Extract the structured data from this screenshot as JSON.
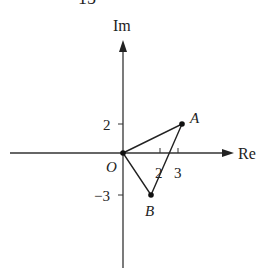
{
  "figure_number": "15",
  "axes": {
    "x_label": "Re",
    "y_label": "Im",
    "origin_label": "O",
    "x_ticks": [
      {
        "value": 2,
        "label": "2"
      },
      {
        "value": 3,
        "label": "3"
      }
    ],
    "y_ticks": [
      {
        "value": 2,
        "label": "2"
      },
      {
        "value": -3,
        "label": "-3"
      }
    ]
  },
  "points": [
    {
      "name": "O",
      "label": "O",
      "re": 0,
      "im": 0
    },
    {
      "name": "A",
      "label": "A",
      "re": 3,
      "im": 2
    },
    {
      "name": "B",
      "label": "B",
      "re": 1.5,
      "im": -3
    }
  ],
  "triangle": [
    "O",
    "A",
    "B"
  ],
  "colors": {
    "stroke": "#222222",
    "background": "#ffffff"
  }
}
